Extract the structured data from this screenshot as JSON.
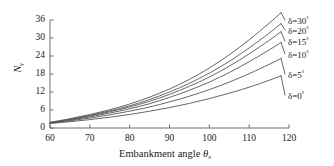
{
  "chart_data": {
    "type": "line",
    "title": "",
    "xlabel": "Embankment angle θs",
    "xlabel_main": "Embankment angle",
    "xlabel_symbol": "θ",
    "xlabel_symbol_sub": "s",
    "ylabel": "Nγ",
    "ylabel_main": "N",
    "ylabel_sub": "γ",
    "xlim": [
      60,
      120
    ],
    "ylim": [
      0,
      36
    ],
    "xticks": [
      60,
      70,
      80,
      90,
      100,
      110,
      120
    ],
    "yticks": [
      0,
      6,
      12,
      18,
      24,
      30,
      36
    ],
    "grid": false,
    "legend_position": "right-inline-end-of-curves",
    "line_color": "#555555",
    "axis_color": "#6e6e6e",
    "x": [
      60,
      65,
      70,
      75,
      80,
      85,
      90,
      95,
      100,
      105,
      110,
      115,
      118
    ],
    "series": [
      {
        "name": "δ=30°",
        "delta": 30,
        "label_main": "δ=30",
        "label_degree": "°",
        "values": [
          1.9,
          3.1,
          4.5,
          6.1,
          8.0,
          10.3,
          13.0,
          16.2,
          20.0,
          24.4,
          29.4,
          34.9,
          38.4
        ]
      },
      {
        "name": "δ=20°",
        "delta": 20,
        "label_main": "δ=20",
        "label_degree": "°",
        "values": [
          1.8,
          2.9,
          4.2,
          5.7,
          7.4,
          9.5,
          12.0,
          14.9,
          18.3,
          22.2,
          26.7,
          31.6,
          34.8
        ]
      },
      {
        "name": "δ=15°",
        "delta": 15,
        "label_main": "δ=15",
        "label_degree": "°",
        "values": [
          1.8,
          2.8,
          4.0,
          5.4,
          7.0,
          8.9,
          11.2,
          13.9,
          17.0,
          20.6,
          24.7,
          29.2,
          32.1
        ]
      },
      {
        "name": "δ=10°",
        "delta": 10,
        "label_main": "δ=10",
        "label_degree": "°",
        "values": [
          1.7,
          2.6,
          3.7,
          5.0,
          6.4,
          8.1,
          10.2,
          12.6,
          15.3,
          18.5,
          22.1,
          26.0,
          28.5
        ]
      },
      {
        "name": "δ=5°",
        "delta": 5,
        "label_main": "δ=5",
        "label_degree": "°",
        "values": [
          1.6,
          2.4,
          3.3,
          4.4,
          5.6,
          7.0,
          8.7,
          10.6,
          12.8,
          15.3,
          18.1,
          21.2,
          23.2
        ]
      },
      {
        "name": "δ=0°",
        "delta": 0,
        "label_main": "δ=0",
        "label_degree": "°",
        "values": [
          1.5,
          2.1,
          2.8,
          3.6,
          4.5,
          5.6,
          6.8,
          8.2,
          9.8,
          11.6,
          13.6,
          15.9,
          17.4
        ]
      }
    ]
  }
}
